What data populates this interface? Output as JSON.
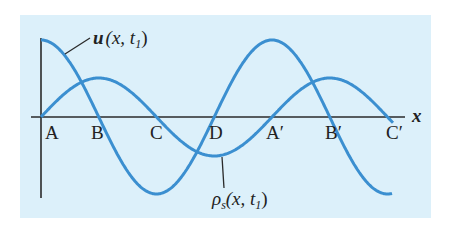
{
  "diagram": {
    "background_color": "#dcf0fa",
    "curve_color": "#3b8fd0",
    "axis_color": "#2a2a2a",
    "axis": {
      "x_label": "x",
      "origin_x": 41,
      "axis_y": 117,
      "x_end": 405,
      "y_top": 38,
      "y_bottom": 198
    },
    "point_labels": [
      {
        "text": "A",
        "x": 45
      },
      {
        "text": "B",
        "x": 91
      },
      {
        "text": "C",
        "x": 150
      },
      {
        "text": "D",
        "x": 209
      },
      {
        "text": "A′",
        "x": 266
      },
      {
        "text": "B′",
        "x": 325
      },
      {
        "text": "C′",
        "x": 386
      }
    ],
    "curves": {
      "displacement": {
        "name": "u",
        "label_main": "u",
        "label_args": "(x, t",
        "label_sub": "1",
        "label_close": ")",
        "amplitude": 77,
        "wavelength": 231,
        "x_start": 41,
        "x_end": 392,
        "form": "cos"
      },
      "density": {
        "name": "rho_s",
        "label_main": "ρ",
        "label_main_sub": "s",
        "label_args": "(x, t",
        "label_sub": "1",
        "label_close": ")",
        "amplitude": 39,
        "wavelength": 231,
        "x_start": 41,
        "x_end": 393,
        "form": "sin"
      }
    }
  }
}
